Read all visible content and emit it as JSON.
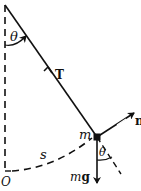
{
  "diagram": {
    "title": "",
    "type": "pendulum free-body diagram",
    "colors": {
      "ink": "#111111",
      "background": "#ffffff"
    },
    "labels": {
      "theta_top": "θ",
      "tension": "T",
      "mass": "m",
      "normal": "n",
      "arc_length": "s",
      "origin": "O",
      "weight": "mg",
      "weight_m": "m",
      "weight_g": "g",
      "theta_bottom": "θ"
    },
    "elements": [
      {
        "id": "vertical-reference",
        "style": "dashed",
        "from": [
          5,
          5
        ],
        "to": [
          5,
          170
        ]
      },
      {
        "id": "string",
        "style": "solid",
        "from": [
          5,
          5
        ],
        "to": [
          97,
          137
        ]
      },
      {
        "id": "string-extension",
        "style": "dashed",
        "from": [
          97,
          137
        ],
        "to": [
          121,
          174
        ]
      },
      {
        "id": "arc-path",
        "style": "dashed",
        "from": "O",
        "to": "m"
      },
      {
        "id": "tension-arrow",
        "direction": "toward pivot"
      },
      {
        "id": "weight-arrow",
        "direction": "down"
      },
      {
        "id": "normal-arrow",
        "direction": "outward along tangent/normal"
      }
    ]
  }
}
